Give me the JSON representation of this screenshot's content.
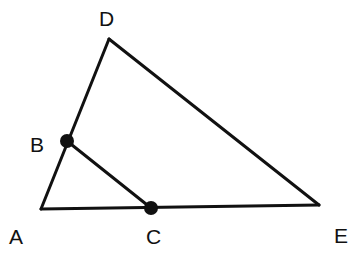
{
  "diagram": {
    "type": "geometry",
    "stroke_color": "#111111",
    "points": {
      "A": {
        "label": "A",
        "x": 41,
        "y": 209,
        "label_x": 9,
        "label_y": 244,
        "dot": false
      },
      "B": {
        "label": "B",
        "x": 67,
        "y": 141,
        "label_x": 30,
        "label_y": 152,
        "dot": true
      },
      "C": {
        "label": "C",
        "x": 151,
        "y": 208,
        "label_x": 146,
        "label_y": 244,
        "dot": true
      },
      "D": {
        "label": "D",
        "x": 109,
        "y": 39,
        "label_x": 99,
        "label_y": 26,
        "dot": false
      },
      "E": {
        "label": "E",
        "x": 319,
        "y": 205,
        "label_x": 334,
        "label_y": 243,
        "dot": false
      }
    },
    "segments": [
      [
        "A",
        "D"
      ],
      [
        "D",
        "E"
      ],
      [
        "A",
        "E"
      ],
      [
        "B",
        "C"
      ]
    ]
  }
}
